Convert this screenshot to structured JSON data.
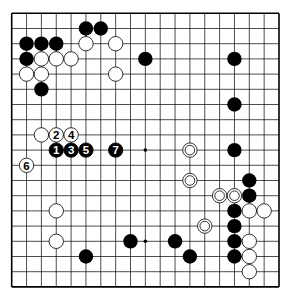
{
  "board": {
    "size": 19,
    "origin_x": 11.7,
    "origin_y": 13.3,
    "spacing_x": 14.85,
    "spacing_y": 15.2,
    "stone_radius": 7.2,
    "line_color": "#000000",
    "board_color": "#ffffff",
    "star_points": [
      [
        9,
        9
      ],
      [
        9,
        15
      ]
    ]
  },
  "stones": {
    "black": [
      [
        5,
        1
      ],
      [
        6,
        1
      ],
      [
        1,
        2
      ],
      [
        2,
        2
      ],
      [
        3,
        2
      ],
      [
        1,
        3
      ],
      [
        9,
        3
      ],
      [
        15,
        3
      ],
      [
        2,
        5
      ],
      [
        15,
        6
      ],
      [
        15,
        9
      ],
      [
        16,
        11
      ],
      [
        16,
        12
      ],
      [
        15,
        13
      ],
      [
        15,
        14
      ],
      [
        11,
        15
      ],
      [
        15,
        15
      ],
      [
        8,
        15
      ],
      [
        12,
        16
      ],
      [
        15,
        16
      ],
      [
        5,
        16
      ]
    ],
    "white": [
      [
        5,
        2
      ],
      [
        7,
        2
      ],
      [
        2,
        3
      ],
      [
        3,
        3
      ],
      [
        4,
        3
      ],
      [
        1,
        4
      ],
      [
        2,
        4
      ],
      [
        7,
        4
      ],
      [
        2,
        8
      ],
      [
        3,
        13
      ],
      [
        3,
        15
      ],
      [
        16,
        13
      ],
      [
        17,
        13
      ],
      [
        16,
        15
      ],
      [
        16,
        16
      ],
      [
        16,
        17
      ]
    ],
    "white_marked": [
      [
        12,
        9
      ],
      [
        12,
        11
      ],
      [
        14,
        12
      ],
      [
        15,
        12
      ],
      [
        13,
        14
      ]
    ]
  },
  "numbered_moves": [
    {
      "label": "1",
      "color": "black",
      "col": 3,
      "row": 9
    },
    {
      "label": "2",
      "color": "white",
      "col": 3,
      "row": 8
    },
    {
      "label": "3",
      "color": "black",
      "col": 4,
      "row": 9
    },
    {
      "label": "4",
      "color": "white",
      "col": 4,
      "row": 8
    },
    {
      "label": "5",
      "color": "black",
      "col": 5,
      "row": 9
    },
    {
      "label": "6",
      "color": "white",
      "col": 1,
      "row": 10
    },
    {
      "label": "7",
      "color": "black",
      "col": 7,
      "row": 9
    }
  ]
}
